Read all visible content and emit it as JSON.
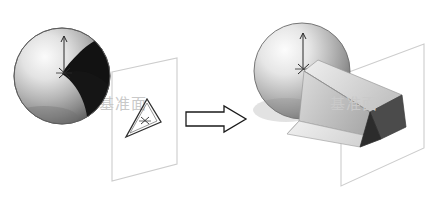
{
  "figure": {
    "background_color": "#ffffff",
    "width": 436,
    "height": 205
  },
  "watermark": {
    "text": "基准面",
    "color": "#c9c9c9",
    "instances": [
      {
        "name": "watermark-left",
        "x": 99,
        "y": 109
      },
      {
        "name": "watermark-right",
        "x": 330,
        "y": 109
      }
    ]
  },
  "transition_arrow": {
    "label": "transforms-into",
    "outline_color": "#1a1a1a",
    "fill_color": "#ffffff",
    "x": 186,
    "y": 106,
    "width": 60,
    "height": 26
  },
  "panels": [
    {
      "id": "before",
      "name": "before-state",
      "caption": "",
      "sphere": {
        "name": "sphere-before",
        "cx": 62,
        "cy": 76,
        "r": 48,
        "highlight_color": "#f2f2f2",
        "mid_color": "#9a9a9a",
        "shadow_color": "#3a3a3a",
        "dark_patch_color": "#131313",
        "outline_color": "#555555"
      },
      "axis_marker": {
        "name": "sphere-axis-marker-before",
        "x": 64,
        "y_top": 36,
        "y_bottom": 73,
        "color": "#2b2b2b"
      },
      "plane": {
        "name": "datum-plane-before",
        "outline_color": "#cdcdcd",
        "fill_color": "none",
        "points": "112,72 177,58 177,164 112,181"
      },
      "profile": {
        "name": "triangle-profile-sketch",
        "outline_color": "#2e2e2e",
        "points": "147,99 161,122 126,137",
        "center_marker": {
          "x": 145,
          "y": 121,
          "color": "#2e2e2e"
        }
      }
    },
    {
      "id": "after",
      "name": "after-state",
      "caption": "",
      "sphere": {
        "name": "sphere-after",
        "cx": 302,
        "cy": 71,
        "r": 48,
        "highlight_color": "#f4f4f4",
        "mid_color": "#a0a0a0",
        "shadow_color": "#5a5a5a",
        "outline_color": "#6a6a6a"
      },
      "axis_marker": {
        "name": "sphere-axis-marker-after",
        "x": 303,
        "y_top": 33,
        "y_bottom": 68,
        "color": "#2b2b2b"
      },
      "plane": {
        "name": "datum-plane-after",
        "outline_color": "#cdcdcd",
        "fill_color": "none",
        "points": "341,75 424,44 424,148 341,186"
      },
      "loft": {
        "name": "loft-solid",
        "faces": [
          {
            "name": "loft-face-top",
            "shade": "#d6d6d6",
            "points": "304,71 316,61 400,96 372,112"
          },
          {
            "name": "loft-face-front",
            "shade": "#c2c2c2",
            "points": "304,71 372,112 382,138 300,120"
          },
          {
            "name": "loft-face-lower",
            "shade": "#e6e6e6",
            "points": "300,120 382,138 362,146 288,133"
          },
          {
            "name": "loft-face-end",
            "shade": "#474747",
            "points": "400,96 372,112 382,138 404,128"
          },
          {
            "name": "loft-face-end-dark",
            "shade": "#2e2e2e",
            "points": "372,112 382,138 362,146"
          }
        ],
        "edge_color": "#8d8d8d"
      }
    }
  ]
}
